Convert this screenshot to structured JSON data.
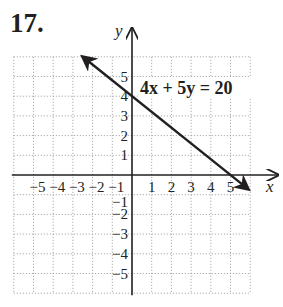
{
  "problem": {
    "number": "17."
  },
  "chart_data": {
    "type": "line",
    "title": "",
    "xlabel": "x",
    "ylabel": "y",
    "xlim": [
      -6,
      6
    ],
    "ylim": [
      -6,
      6
    ],
    "grid": true,
    "x_ticks": [
      -5,
      -4,
      -3,
      -2,
      -1,
      1,
      2,
      3,
      4,
      5
    ],
    "y_ticks": [
      -5,
      -4,
      -3,
      -2,
      -1,
      1,
      2,
      3,
      4,
      5
    ],
    "x_tick_labels": [
      "−5",
      "−4",
      "−3",
      "−2",
      "−1",
      "1",
      "2",
      "3",
      "4",
      "5"
    ],
    "y_tick_labels": [
      "−5",
      "−4",
      "−3",
      "−2",
      "−1",
      "1",
      "2",
      "3",
      "4",
      "5"
    ],
    "series": [
      {
        "name": "4x + 5y = 20",
        "equation": "4x + 5y = 20",
        "x": [
          -2.5,
          5.9
        ],
        "y": [
          6.0,
          -0.72
        ],
        "arrows_both_ends": true,
        "color": "#231f20"
      }
    ],
    "annotations": [
      {
        "text": "4x + 5y = 20",
        "x": 0.3,
        "y": 4.4
      }
    ],
    "intercepts": {
      "y_intercept": [
        0,
        4
      ],
      "x_intercept": [
        5,
        0
      ]
    }
  },
  "colors": {
    "ink": "#231f20",
    "grid": "#9a9a9a"
  }
}
